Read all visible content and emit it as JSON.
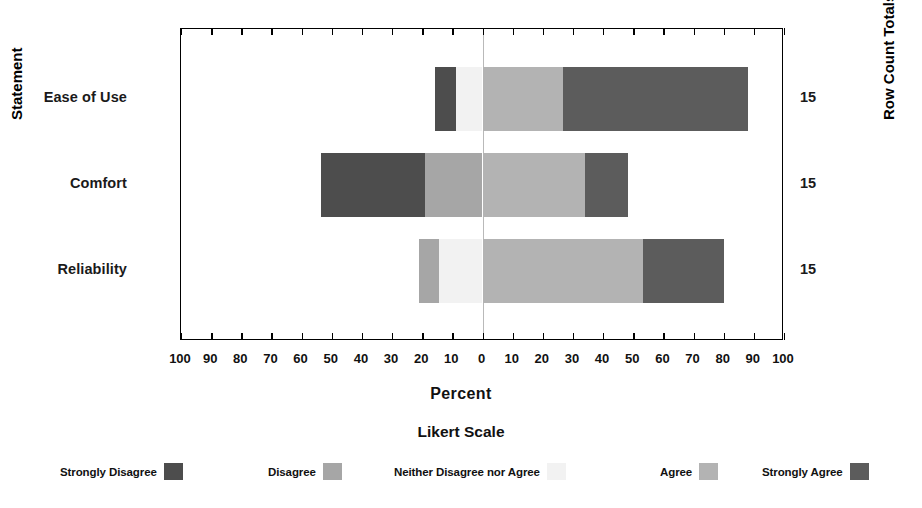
{
  "axes": {
    "y_left_title": "Statement",
    "y_right_title": "Row Count Totals",
    "x_title": "Percent",
    "x_ticklabels": [
      "100",
      "90",
      "80",
      "70",
      "60",
      "50",
      "40",
      "30",
      "20",
      "10",
      "0",
      "10",
      "20",
      "30",
      "40",
      "50",
      "60",
      "70",
      "80",
      "90",
      "100"
    ]
  },
  "legend": {
    "title": "Likert Scale",
    "items": [
      {
        "label": "Strongly Disagree",
        "color": "#4d4d4d"
      },
      {
        "label": "Disagree",
        "color": "#a6a6a6"
      },
      {
        "label": "Neither Disagree nor Agree",
        "color": "#f2f2f2"
      },
      {
        "label": "Agree",
        "color": "#b3b3b3"
      },
      {
        "label": "Strongly Agree",
        "color": "#5c5c5c"
      }
    ]
  },
  "rows": [
    {
      "category": "Ease of Use",
      "total": "15"
    },
    {
      "category": "Comfort",
      "total": "15"
    },
    {
      "category": "Reliability",
      "total": "15"
    }
  ],
  "chart_data": {
    "type": "bar",
    "subtype": "diverging-stacked-likert",
    "title": "",
    "xlabel": "Percent",
    "ylabel": "Statement",
    "y2label": "Row Count Totals",
    "xlim": [
      -100,
      100
    ],
    "xticks": [
      -100,
      -90,
      -80,
      -70,
      -60,
      -50,
      -40,
      -30,
      -20,
      -10,
      0,
      10,
      20,
      30,
      40,
      50,
      60,
      70,
      80,
      90,
      100
    ],
    "xticklabels": [
      "100",
      "90",
      "80",
      "70",
      "60",
      "50",
      "40",
      "30",
      "20",
      "10",
      "0",
      "10",
      "20",
      "30",
      "40",
      "50",
      "60",
      "70",
      "80",
      "90",
      "100"
    ],
    "grid": false,
    "legend_position": "bottom",
    "legend_title": "Likert Scale",
    "categories": [
      "Ease of Use",
      "Comfort",
      "Reliability"
    ],
    "row_count_totals": [
      15,
      15,
      15
    ],
    "series": [
      {
        "name": "Strongly Disagree",
        "color": "#4d4d4d",
        "values": [
          7,
          35,
          0
        ]
      },
      {
        "name": "Disagree",
        "color": "#a6a6a6",
        "values": [
          0,
          19,
          7
        ]
      },
      {
        "name": "Neither Disagree nor Agree",
        "color": "#f2f2f2",
        "values": [
          9,
          0,
          14
        ]
      },
      {
        "name": "Agree",
        "color": "#b3b3b3",
        "values": [
          27,
          34,
          53
        ]
      },
      {
        "name": "Strongly Agree",
        "color": "#5c5c5c",
        "values": [
          61,
          14,
          27
        ]
      }
    ],
    "bars": [
      {
        "category": "Ease of Use",
        "segments": [
          {
            "name": "Strongly Disagree",
            "start": -15.7,
            "end": -8.7,
            "color": "#4d4d4d"
          },
          {
            "name": "Neither Disagree nor Agree",
            "start": -8.7,
            "end": 0,
            "color": "#f2f2f2"
          },
          {
            "name": "Agree",
            "start": 0,
            "end": 26.7,
            "color": "#b3b3b3"
          },
          {
            "name": "Strongly Agree",
            "start": 26.7,
            "end": 88.0,
            "color": "#5c5c5c"
          }
        ]
      },
      {
        "category": "Comfort",
        "segments": [
          {
            "name": "Strongly Disagree",
            "start": -53.7,
            "end": -19.0,
            "color": "#4d4d4d"
          },
          {
            "name": "Disagree",
            "start": -19.0,
            "end": 0,
            "color": "#a6a6a6"
          },
          {
            "name": "Agree",
            "start": 0,
            "end": 34.0,
            "color": "#b3b3b3"
          },
          {
            "name": "Strongly Agree",
            "start": 34.0,
            "end": 48.3,
            "color": "#5c5c5c"
          }
        ]
      },
      {
        "category": "Reliability",
        "segments": [
          {
            "name": "Disagree",
            "start": -21.0,
            "end": -14.3,
            "color": "#a6a6a6"
          },
          {
            "name": "Neither Disagree nor Agree",
            "start": -14.3,
            "end": 0,
            "color": "#f2f2f2"
          },
          {
            "name": "Agree",
            "start": 0,
            "end": 53.3,
            "color": "#b3b3b3"
          },
          {
            "name": "Strongly Agree",
            "start": 53.3,
            "end": 80.0,
            "color": "#5c5c5c"
          }
        ]
      }
    ]
  }
}
